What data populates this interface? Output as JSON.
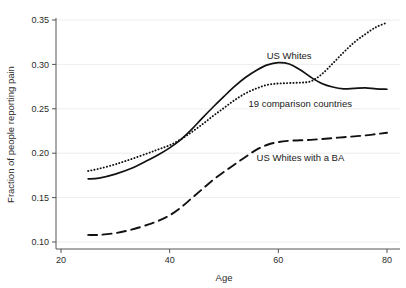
{
  "chart_data": {
    "type": "line",
    "title": "",
    "xlabel": "Age",
    "ylabel": "Fraction of people reporting pain",
    "xlim": [
      20,
      80
    ],
    "ylim": [
      0.1,
      0.35
    ],
    "xticks": [
      20,
      40,
      60,
      80
    ],
    "xticklabels": [
      "20",
      "40",
      "60",
      "80"
    ],
    "yticks": [
      0.1,
      0.15,
      0.2,
      0.25,
      0.3,
      0.35
    ],
    "yticklabels": [
      "0.10",
      "0.15",
      "0.20",
      "0.25",
      "0.30",
      "0.35"
    ],
    "grid": "horizontal-faint",
    "legend": "inline-annotations",
    "line_color": "#111111",
    "series": [
      {
        "name": "US Whites",
        "style": "solid",
        "label_x": 62,
        "label_y": 0.3065,
        "x": [
          25,
          27,
          30,
          33,
          36,
          38,
          40,
          42,
          44,
          46,
          48,
          50,
          52,
          54,
          56,
          58,
          60,
          62,
          64,
          66,
          68,
          70,
          72,
          74,
          76,
          78,
          80
        ],
        "y": [
          0.171,
          0.172,
          0.1765,
          0.183,
          0.192,
          0.1985,
          0.206,
          0.215,
          0.2265,
          0.2395,
          0.252,
          0.264,
          0.2755,
          0.2855,
          0.2935,
          0.2995,
          0.302,
          0.3005,
          0.294,
          0.2855,
          0.2785,
          0.2745,
          0.2725,
          0.273,
          0.2735,
          0.2725,
          0.272
        ]
      },
      {
        "name": "19 comparison countries",
        "style": "dotted",
        "label_x": 54.5,
        "label_y": 0.2525,
        "x": [
          25,
          27,
          30,
          33,
          36,
          38,
          40,
          42,
          44,
          46,
          48,
          50,
          52,
          54,
          56,
          58,
          60,
          62,
          64,
          66,
          68,
          70,
          72,
          74,
          76,
          78,
          80
        ],
        "y": [
          0.18,
          0.1825,
          0.1875,
          0.1935,
          0.2,
          0.2045,
          0.209,
          0.2155,
          0.2235,
          0.2325,
          0.242,
          0.251,
          0.26,
          0.2675,
          0.273,
          0.277,
          0.2785,
          0.279,
          0.2795,
          0.281,
          0.289,
          0.301,
          0.3135,
          0.325,
          0.334,
          0.342,
          0.347
        ]
      },
      {
        "name": "US Whites with a BA",
        "style": "dashed",
        "label_x": 56,
        "label_y": 0.191,
        "x": [
          25,
          27,
          30,
          33,
          36,
          38,
          40,
          42,
          44,
          46,
          48,
          50,
          52,
          54,
          56,
          58,
          60,
          62,
          64,
          66,
          68,
          70,
          72,
          74,
          76,
          78,
          80
        ],
        "y": [
          0.108,
          0.108,
          0.11,
          0.114,
          0.1195,
          0.124,
          0.13,
          0.1385,
          0.149,
          0.1595,
          0.17,
          0.179,
          0.1875,
          0.196,
          0.204,
          0.2095,
          0.2125,
          0.214,
          0.2145,
          0.215,
          0.216,
          0.217,
          0.218,
          0.219,
          0.22,
          0.2215,
          0.223
        ]
      }
    ]
  }
}
